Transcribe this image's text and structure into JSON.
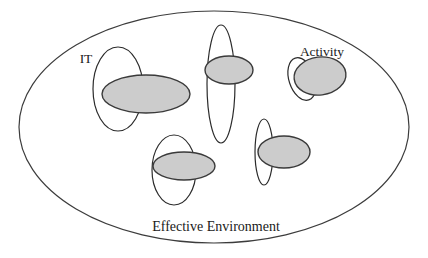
{
  "diagram": {
    "type": "venn-overlap-concept-diagram",
    "title_label": "Effective Environment",
    "labels": {
      "it": "IT",
      "activity": "Activity",
      "boundary": "Effective Environment"
    },
    "colors": {
      "background": "#ffffff",
      "stroke": "#2b2b2b",
      "shaded_fill": "#cccccc",
      "shaded_stroke": "#3a3a3a",
      "boundary_stroke": "#3c3c3c",
      "text": "#1a1a1a"
    },
    "boundary_ellipse": {
      "name": "Effective Environment",
      "cx": 214,
      "cy": 127,
      "rx": 195,
      "ry": 116,
      "fill": "none"
    },
    "pairs": [
      {
        "id": "pair-it",
        "label": "IT",
        "white_ellipse": {
          "cx": 118,
          "cy": 89,
          "rx": 25,
          "ry": 42,
          "rotate": 0
        },
        "shaded_ellipse": {
          "cx": 146,
          "cy": 94,
          "rx": 44,
          "ry": 19,
          "rotate": 0
        }
      },
      {
        "id": "pair-top-center",
        "label": "",
        "white_ellipse": {
          "cx": 221,
          "cy": 84,
          "rx": 14,
          "ry": 59,
          "rotate": 0
        },
        "shaded_ellipse": {
          "cx": 229,
          "cy": 70,
          "rx": 24,
          "ry": 14,
          "rotate": 0
        }
      },
      {
        "id": "pair-activity",
        "label": "Activity",
        "white_ellipse": {
          "cx": 302,
          "cy": 79,
          "rx": 13,
          "ry": 22,
          "rotate": -18
        },
        "shaded_ellipse": {
          "cx": 320,
          "cy": 76,
          "rx": 26,
          "ry": 19,
          "rotate": -7
        }
      },
      {
        "id": "pair-bottom-center",
        "label": "",
        "white_ellipse": {
          "cx": 174,
          "cy": 170,
          "rx": 22,
          "ry": 35,
          "rotate": 0
        },
        "shaded_ellipse": {
          "cx": 184,
          "cy": 166,
          "rx": 31,
          "ry": 14,
          "rotate": 0
        }
      },
      {
        "id": "pair-right-center",
        "label": "",
        "white_ellipse": {
          "cx": 264,
          "cy": 152,
          "rx": 9,
          "ry": 33,
          "rotate": 0
        },
        "shaded_ellipse": {
          "cx": 284,
          "cy": 152,
          "rx": 26,
          "ry": 16,
          "rotate": 0
        }
      }
    ],
    "label_positions": {
      "it": {
        "x": 86,
        "y": 63
      },
      "activity": {
        "x": 322,
        "y": 56
      },
      "boundary": {
        "x": 216,
        "y": 231
      }
    },
    "shaded_count": 5,
    "white_count": 5,
    "legend_note": ""
  }
}
